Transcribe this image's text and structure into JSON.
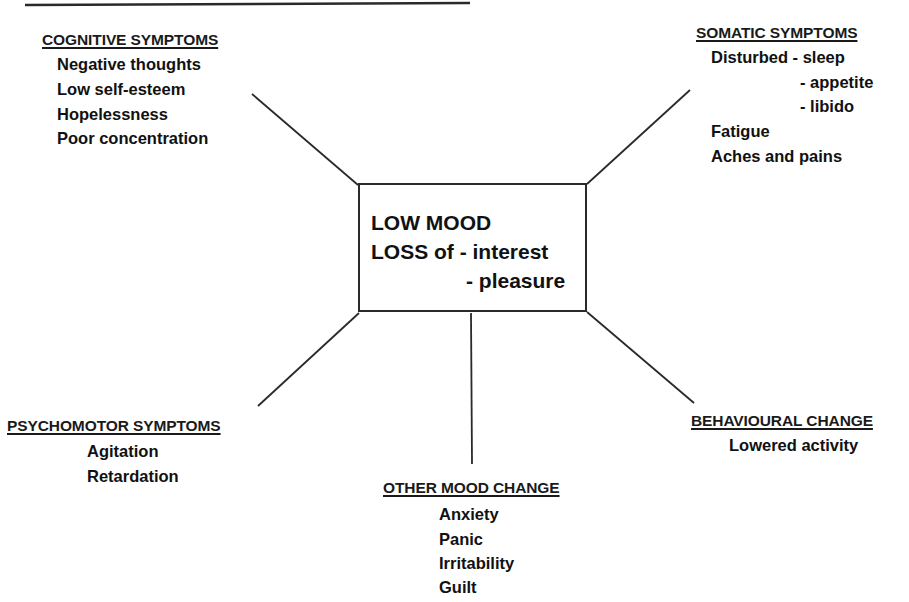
{
  "diagram": {
    "center": {
      "lines": [
        "LOW MOOD",
        "LOSS of - interest",
        "- pleasure"
      ]
    },
    "groups": {
      "cognitive": {
        "heading": "COGNITIVE SYMPTOMS",
        "items": [
          "Negative thoughts",
          "Low self-esteem",
          "Hopelessness",
          "Poor concentration"
        ]
      },
      "somatic": {
        "heading": "SOMATIC SYMPTOMS",
        "items": [
          "Disturbed - sleep",
          "- appetite",
          "- libido",
          "Fatigue",
          "Aches and pains"
        ]
      },
      "psychomotor": {
        "heading": "PSYCHOMOTOR SYMPTOMS",
        "items": [
          "Agitation",
          "Retardation"
        ]
      },
      "behavioural": {
        "heading": "BEHAVIOURAL CHANGE",
        "items": [
          "Lowered activity"
        ]
      },
      "other_mood": {
        "heading": "OTHER MOOD CHANGE",
        "items": [
          "Anxiety",
          "Panic",
          "Irritability",
          "Guilt"
        ]
      }
    },
    "colors": {
      "ink": "#111111",
      "line": "#2a2a2a",
      "background": "#ffffff"
    }
  }
}
